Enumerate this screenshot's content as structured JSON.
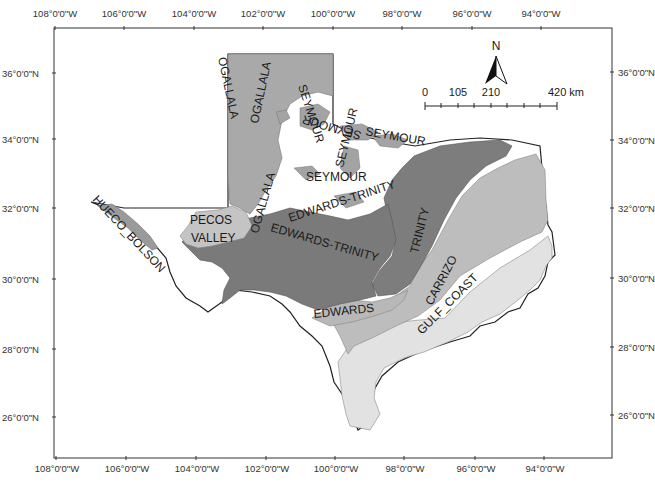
{
  "map": {
    "title": "",
    "region": "Texas",
    "colors": {
      "ogallala": "#a9a9a9",
      "seymour": "#a3a3a3",
      "edwards_trinity": "#7a7a7a",
      "trinity": "#7d7d7d",
      "pecos_valley": "#c4c4c4",
      "hueco_bolson": "#9a9a9a",
      "carrizo": "#bdbdbd",
      "edwards": "#b8b8b8",
      "gulf_coast": "#e2e2e2",
      "outline": "#222222",
      "background": "#ffffff"
    },
    "graticule": {
      "top_longitudes": [
        "108°0'0\"W",
        "106°0'0\"W",
        "104°0'0\"W",
        "102°0'0\"W",
        "100°0'0\"W",
        "98°0'0\"W",
        "96°0'0\"W",
        "94°0'0\"W"
      ],
      "bottom_longitudes": [
        "108°0'0\"W",
        "106°0'0\"W",
        "104°0'0\"W",
        "102°0'0\"W",
        "100°0'0\"W",
        "98°0'0\"W",
        "96°0'0\"W",
        "94°0'0\"W"
      ],
      "left_latitudes": [
        "36°0'0\"N",
        "34°0'0\"N",
        "32°0'0\"N",
        "30°0'0\"N",
        "28°0'0\"N",
        "26°0'0\"N"
      ],
      "right_latitudes": [
        "36°0'0\"N",
        "34°0'0\"N",
        "32°0'0\"N",
        "30°0'0\"N",
        "28°0'0\"N",
        "26°0'0\"N"
      ]
    },
    "north_arrow": {
      "label": "N"
    },
    "scale_bar": {
      "labels": [
        "0",
        "105",
        "210",
        "420 km"
      ],
      "unit": "km"
    },
    "aquifer_labels": {
      "ogallala_1": "OGALLALA",
      "ogallala_2": "OGALLALA",
      "ogallala_3": "OGALLALA",
      "seymour_1": "SEYMOUR",
      "seymour_2": "SEYMOUR",
      "seymour_3": "SEYMOUR",
      "seymour_4": "SEYMOUR",
      "seymour_5": "SEYMOUR",
      "edwards_trinity_1": "EDWARDS-TRINITY",
      "edwards_trinity_2": "EDWARDS-TRINITY",
      "trinity": "TRINITY",
      "pecos": "PECOS",
      "valley": "VALLEY",
      "hueco_bolson": "HUECO_BOLSON",
      "carrizo": "CARRIZO",
      "edwards": "EDWARDS",
      "gulf_coast": "GULF_COAST"
    }
  }
}
